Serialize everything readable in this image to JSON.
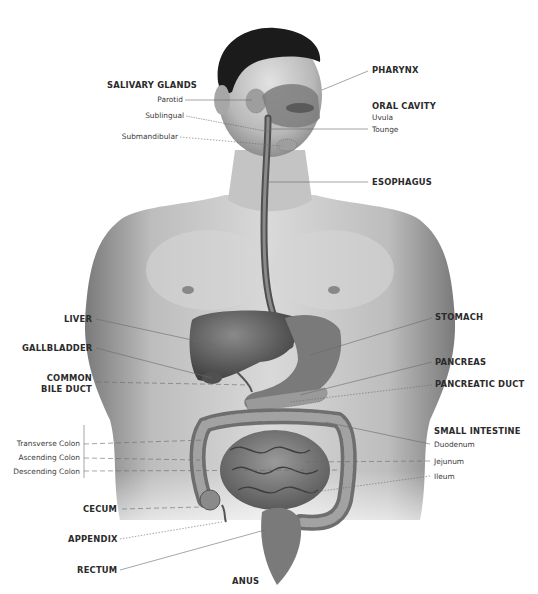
{
  "diagram": {
    "colors": {
      "background": "#ffffff",
      "skin_light": "#d8d8d8",
      "skin_mid": "#a9a9a9",
      "organ_dark": "#4a4a4a",
      "hair": "#1b1b1b",
      "label_text": "#2b2b2b",
      "leader_line": "#6a6a6a"
    },
    "labels": {
      "salivary_glands": {
        "title": "SALIVARY GLANDS",
        "parts": [
          "Parotid",
          "Sublingual",
          "Submandibular"
        ]
      },
      "pharynx": "PHARYNX",
      "oral_cavity": {
        "title": "ORAL CAVITY",
        "parts": [
          "Uvula",
          "Tounge"
        ]
      },
      "esophagus": "ESOPHAGUS",
      "liver": "LIVER",
      "gallbladder": "GALLBLADDER",
      "common_bile_duct": [
        "COMMON",
        "BILE DUCT"
      ],
      "stomach": "STOMACH",
      "pancreas": "PANCREAS",
      "pancreatic_duct": "PANCREATIC DUCT",
      "small_intestine": {
        "title": "SMALL INTESTINE",
        "parts": [
          "Duodenum",
          "Jejunum",
          "Ileum"
        ]
      },
      "colon": [
        "Transverse Colon",
        "Ascending Colon",
        "Descending Colon"
      ],
      "cecum": "CECUM",
      "appendix": "APPENDIX",
      "rectum": "RECTUM",
      "anus": "ANUS"
    }
  }
}
